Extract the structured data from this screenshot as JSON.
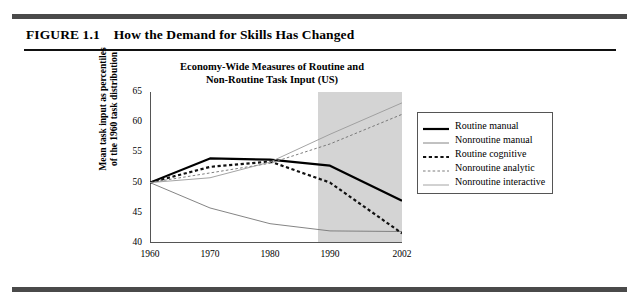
{
  "figure": {
    "number_label": "FIGURE 1.1",
    "caption": "How the Demand for Skills Has Changed"
  },
  "chart_data": {
    "type": "line",
    "title": "Economy-Wide Measures of Routine and Non-Routine Task Input (US)",
    "title_line1": "Economy-Wide Measures of Routine and",
    "title_line2": "Non-Routine Task Input (US)",
    "xlabel": "",
    "ylabel": "Mean task input as percentiles of the 1960 task distribution",
    "ylabel_line1": "Mean task input as percentiles",
    "ylabel_line2": "of the 1960 task distribution",
    "x": [
      1960,
      1970,
      1980,
      1990,
      2002
    ],
    "xlim": [
      1960,
      2002
    ],
    "ylim": [
      40,
      65
    ],
    "yticks": [
      40,
      45,
      50,
      55,
      60,
      65
    ],
    "xticks": [
      1960,
      1970,
      1980,
      1990,
      2002
    ],
    "xtick_labels": [
      "1960",
      "1970",
      "1980",
      "1990",
      "2002"
    ],
    "ytick_labels": [
      "40",
      "45",
      "50",
      "55",
      "60",
      "65"
    ],
    "grid": false,
    "legend_position": "right",
    "shaded_region": {
      "label": "projection",
      "x_start": 1988,
      "x_end": 2002,
      "color": "#d4d4d4"
    },
    "series": [
      {
        "name": "Routine manual",
        "style": "solid",
        "width": "thick",
        "color": "#000000",
        "values": [
          50.0,
          54.0,
          53.8,
          52.8,
          47.0
        ]
      },
      {
        "name": "Nonroutine manual",
        "style": "solid",
        "width": "thin",
        "color": "#767676",
        "values": [
          50.0,
          45.8,
          43.2,
          42.0,
          41.9
        ]
      },
      {
        "name": "Routine cognitive",
        "style": "dashed",
        "width": "thick",
        "color": "#111111",
        "values": [
          50.0,
          52.6,
          53.5,
          50.0,
          41.6
        ]
      },
      {
        "name": "Nonroutine analytic",
        "style": "dashed",
        "width": "thin",
        "color": "#6e6e6e",
        "values": [
          50.0,
          51.6,
          53.2,
          56.4,
          61.3
        ]
      },
      {
        "name": "Nonroutine interactive",
        "style": "solid",
        "width": "thin-light",
        "color": "#9a9a9a",
        "values": [
          50.0,
          50.8,
          53.4,
          58.0,
          63.2
        ]
      }
    ]
  },
  "legend": {
    "items": [
      {
        "label": "Routine manual",
        "swatch": "thick-solid-black"
      },
      {
        "label": "Nonroutine manual",
        "swatch": "thin-solid-gray"
      },
      {
        "label": "Routine cognitive",
        "swatch": "thick-dashed-black"
      },
      {
        "label": "Nonroutine analytic",
        "swatch": "thin-dashed-gray"
      },
      {
        "label": "Nonroutine interactive",
        "swatch": "thin-solid-light"
      }
    ]
  }
}
